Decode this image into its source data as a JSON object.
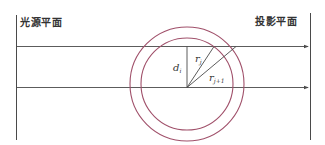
{
  "labels": {
    "source_plane": "光源平面",
    "projection_plane": "投影平面",
    "d_main": "d",
    "d_sub": "i",
    "r_inner_main": "r",
    "r_inner_sub": "j",
    "r_outer_main": "r",
    "r_outer_sub": "j+1"
  },
  "colors": {
    "line": "#4a4a4a",
    "circle": "#a0506a",
    "text": "#333333"
  }
}
